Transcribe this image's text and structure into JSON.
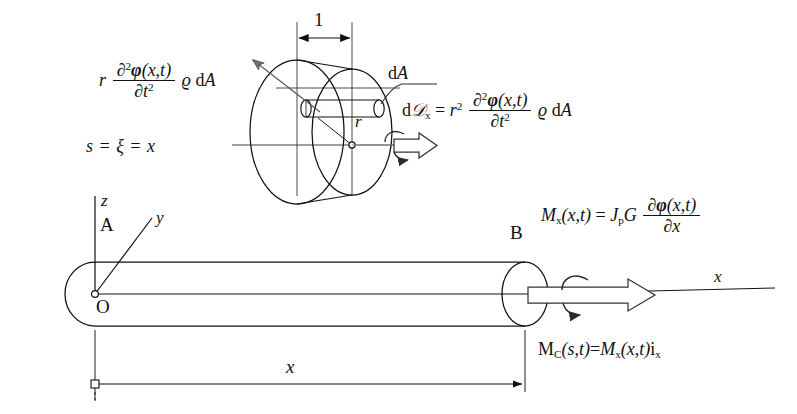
{
  "figure": {
    "background": "#ffffff",
    "stroke": "#111111",
    "arrow_fill": "#6f6f6f",
    "width": 797,
    "height": 414
  },
  "equations": {
    "inertia_force": {
      "lead": "r",
      "num_d": "∂",
      "num_sup": "2",
      "num_phi": "φ",
      "num_args": "(x,t)",
      "den_d": "∂",
      "den_t": "t",
      "den_sup": "2",
      "rho": "ϱ",
      "dA": "d",
      "dA2": "A"
    },
    "arclength": "s = ξ = x",
    "dD_x": {
      "d": "d",
      "D": "𝒟",
      "sub": "x",
      "eq": "=",
      "r": "r",
      "r_sup": "2",
      "num_d": "∂",
      "num_sup": "2",
      "num_phi": "φ",
      "num_args": "(x,t)",
      "den_d": "∂",
      "den_t": "t",
      "den_sup": "2",
      "rho": "ϱ",
      "dA": "d",
      "dA2": "A"
    },
    "moment_x": {
      "M": "M",
      "sub": "x",
      "args": "(x,t)",
      "eq": "=",
      "J": "J",
      "Jsub": "p",
      "G": "G",
      "num_d": "∂",
      "num_phi": "φ",
      "num_args": "(x,t)",
      "den_d": "∂",
      "den_x": "x"
    },
    "moment_vector": {
      "M": "M",
      "subC": "C",
      "args1": "(s,t)",
      "eq": "=",
      "M2": "M",
      "subx": "x",
      "args2": "(x,t)",
      "i": "i",
      "isub": "x"
    }
  },
  "labels": {
    "unit_length": "1",
    "dA_callout_d": "d",
    "dA_callout_A": "A",
    "radius": "r",
    "axis_z": "z",
    "axis_y": "y",
    "axis_x": "x",
    "point_A": "A",
    "point_B": "B",
    "origin_O": "O",
    "dimension_x": "x"
  }
}
